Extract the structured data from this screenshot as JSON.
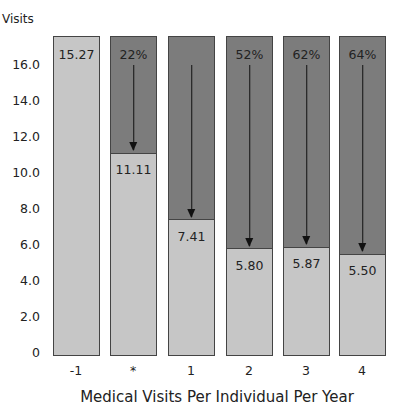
{
  "chart_data": {
    "type": "bar",
    "title": "",
    "ylabel": "Visits",
    "xlabel": "Medical Visits Per Individual Per Year",
    "ylim": [
      0,
      17.6
    ],
    "yticks": [
      "0",
      "2.0",
      "4.0",
      "6.0",
      "8.0",
      "10.0",
      "12.0",
      "14.0",
      "16.0"
    ],
    "categories": [
      "-1",
      "*",
      "1",
      "2",
      "3",
      "4"
    ],
    "values": [
      15.27,
      11.11,
      7.41,
      5.8,
      5.87,
      5.5
    ],
    "value_labels": [
      "15.27",
      "11.11",
      "7.41",
      "5.80",
      "5.87",
      "5.50"
    ],
    "reduction_labels": [
      "",
      "22%",
      "",
      "52%",
      "62%",
      "64%"
    ],
    "has_arrow": [
      false,
      true,
      true,
      true,
      true,
      true
    ],
    "grid": false,
    "legend": null,
    "colors": {
      "value_fill": "#c6c6c6",
      "reduction_fill": "#7c7c7c",
      "border": "#444444"
    }
  }
}
